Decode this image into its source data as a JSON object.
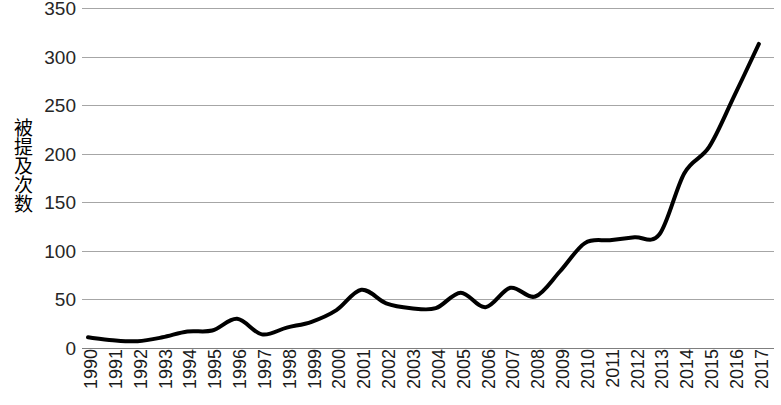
{
  "chart_data": {
    "type": "line",
    "title": "",
    "subtitle": "",
    "xlabel": "",
    "ylabel": "被提及次数",
    "categories": [
      "1990",
      "1991",
      "1992",
      "1993",
      "1994",
      "1995",
      "1996",
      "1997",
      "1998",
      "1999",
      "2000",
      "2001",
      "2002",
      "2003",
      "2004",
      "2005",
      "2006",
      "2007",
      "2008",
      "2009",
      "2010",
      "2011",
      "2012",
      "2013",
      "2014",
      "2015",
      "2016",
      "2017"
    ],
    "values": [
      11,
      8,
      7,
      11,
      17,
      18,
      30,
      14,
      21,
      27,
      39,
      60,
      46,
      41,
      41,
      57,
      42,
      62,
      53,
      79,
      108,
      111,
      114,
      117,
      180,
      207,
      259,
      313
    ],
    "series": [
      {
        "name": "被提及次数",
        "values": [
          11,
          8,
          7,
          11,
          17,
          18,
          30,
          14,
          21,
          27,
          39,
          60,
          46,
          41,
          41,
          57,
          42,
          62,
          53,
          79,
          108,
          111,
          114,
          117,
          180,
          207,
          259,
          313
        ],
        "color": "#000000",
        "line_width": 4,
        "smooth": true,
        "markers": false
      }
    ],
    "ylim": [
      0,
      350
    ],
    "yticks": [
      0,
      50,
      100,
      150,
      200,
      250,
      300,
      350
    ],
    "ytick_labels": [
      "0",
      "50",
      "100",
      "150",
      "200",
      "250",
      "300",
      "350"
    ],
    "xlim": [
      "1990",
      "2017"
    ],
    "grid": {
      "horizontal": true,
      "vertical": false,
      "color": "#a6a6a6"
    },
    "legend": {
      "visible": false,
      "position": "none",
      "entries": []
    },
    "annotations": [],
    "background_color": "#ffffff",
    "axis_color": "#7f7f7f",
    "x_label_rotation": 90
  }
}
